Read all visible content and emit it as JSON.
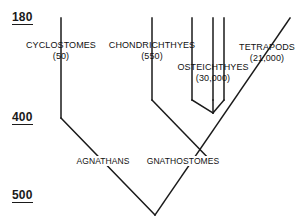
{
  "figure": {
    "type": "cladogram"
  },
  "scale": {
    "unit_note": "millions of years",
    "ticks": [
      {
        "label": "180",
        "y": 18
      },
      {
        "label": "400",
        "y": 118
      },
      {
        "label": "500",
        "y": 196
      }
    ]
  },
  "taxa": [
    {
      "id": "cyclostomes",
      "name": "CYCLOSTOMES",
      "count": "(50)",
      "label_x": 61,
      "label_y": 40,
      "tip_x": 61,
      "tip_y": 18
    },
    {
      "id": "chondrichthyes",
      "name": "CHONDRICHTHYES",
      "count": "(550)",
      "label_x": 152,
      "label_y": 40,
      "tip_x": 152,
      "tip_y": 18
    },
    {
      "id": "osteichthyes",
      "name": "OSTEICHTHYES",
      "count": "(30,000)",
      "label_x": 213,
      "label_y": 62,
      "tip_x": 213,
      "tip_y": 18
    },
    {
      "id": "tetrapods",
      "name": "TETRAPODS",
      "count": "(21,000)",
      "label_x": 267,
      "label_y": 42,
      "tip_x": 290,
      "tip_y": 18
    }
  ],
  "nodes": [
    {
      "id": "agnathans",
      "name": "AGNATHANS",
      "label_x": 103,
      "label_y": 156
    },
    {
      "id": "gnathostomes",
      "name": "GNATHOSTOMES",
      "label_x": 183,
      "label_y": 156
    }
  ],
  "branches": [
    {
      "id": "cyclostomes-stem",
      "points": "61,18 61,118"
    },
    {
      "id": "cyclostomes-to-agnathans",
      "points": "61,118 155,215"
    },
    {
      "id": "chondrichthyes-stem",
      "points": "152,18 152,100"
    },
    {
      "id": "chondrichthyes-to-gnathostomes",
      "points": "152,100 213,163"
    },
    {
      "id": "osteichthyes-tip-left",
      "points": "192,18 192,100"
    },
    {
      "id": "osteichthyes-tip-mid",
      "points": "213,18 213,100"
    },
    {
      "id": "osteichthyes-tip-right",
      "points": "224,18 224,100"
    },
    {
      "id": "osteichthyes-left-to-node",
      "points": "192,100 213,113"
    },
    {
      "id": "osteichthyes-mid-to-node",
      "points": "213,100 213,113"
    },
    {
      "id": "osteichthyes-right-to-node",
      "points": "224,100 213,113"
    },
    {
      "id": "tetrapods-to-gnathostomes",
      "points": "290,18 155,215"
    }
  ],
  "colors": {
    "line": "#1a1a1a",
    "text": "#111111",
    "background": "#ffffff"
  }
}
